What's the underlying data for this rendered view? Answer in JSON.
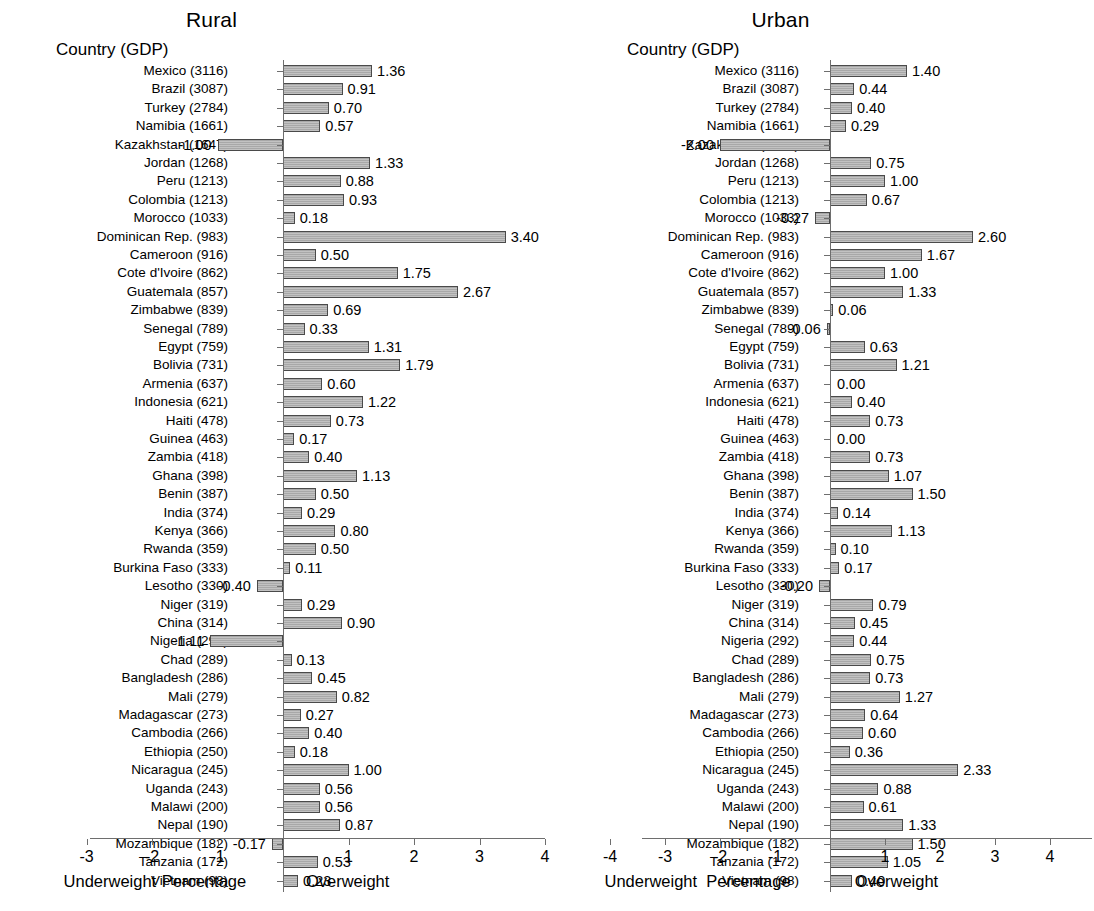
{
  "figure": {
    "bar_fill": "#a8a8a8",
    "bar_stroke": "#4a4a4a",
    "axis_color": "#6e6e6e"
  },
  "panels": [
    {
      "id": "rural",
      "title": "Rural",
      "column_header": "Country (GDP)",
      "axis": {
        "caption_left": "Underweight",
        "caption_center": "Percentage",
        "caption_right": "Overweight",
        "ticks": [
          -3,
          -2,
          -1,
          1,
          2,
          3,
          4
        ],
        "tick_labels": [
          "-3",
          "-2",
          "-1",
          "1",
          "2",
          "3",
          "4"
        ],
        "xlim": [
          -3.6,
          4.4
        ]
      }
    },
    {
      "id": "urban",
      "title": "Urban",
      "column_header": "Country (GDP)",
      "axis": {
        "caption_left": "Underweight",
        "caption_center": "Percentage",
        "caption_right": "Overweight",
        "ticks": [
          -4,
          -3,
          -2,
          -1,
          1,
          2,
          3,
          4
        ],
        "tick_labels": [
          "-4",
          "-3",
          "-2",
          "-1",
          "1",
          "2",
          "3",
          "4"
        ],
        "xlim": [
          -4.4,
          4.4
        ]
      }
    }
  ],
  "chart_data": [
    {
      "type": "bar",
      "orientation": "horizontal",
      "title": "Rural",
      "xlabel": "Percentage",
      "ylabel": "Country (GDP)",
      "xlim": [
        -3.6,
        4.4
      ],
      "grid": false,
      "legend": "none",
      "annotations": [
        "Underweight",
        "Percentage",
        "Overweight"
      ],
      "categories": [
        "Mexico (3116)",
        "Brazil (3087)",
        "Turkey (2784)",
        "Namibia (1661)",
        "Kazakhstan (1647)",
        "Jordan (1268)",
        "Peru (1213)",
        "Colombia (1213)",
        "Morocco (1033)",
        "Dominican Rep. (983)",
        "Cameroon (916)",
        "Cote d'Ivoire (862)",
        "Guatemala (857)",
        "Zimbabwe (839)",
        "Senegal (789)",
        "Egypt (759)",
        "Bolivia (731)",
        "Armenia (637)",
        "Indonesia (621)",
        "Haiti (478)",
        "Guinea (463)",
        "Zambia (418)",
        "Ghana (398)",
        "Benin (387)",
        "India (374)",
        "Kenya (366)",
        "Rwanda (359)",
        "Burkina Faso (333)",
        "Lesotho (330)",
        "Niger (319)",
        "China (314)",
        "Nigeria (292)",
        "Chad (289)",
        "Bangladesh (286)",
        "Mali (279)",
        "Madagascar (273)",
        "Cambodia (266)",
        "Ethiopia (250)",
        "Nicaragua (245)",
        "Uganda (243)",
        "Malawi (200)",
        "Nepal (190)",
        "Mozambique (182)",
        "Tanzania (172)",
        "Vietnam (98)"
      ],
      "values": [
        1.36,
        0.91,
        0.7,
        0.57,
        -1.0,
        1.33,
        0.88,
        0.93,
        0.18,
        3.4,
        0.5,
        1.75,
        2.67,
        0.69,
        0.33,
        1.31,
        1.79,
        0.6,
        1.22,
        0.73,
        0.17,
        0.4,
        1.13,
        0.5,
        0.29,
        0.8,
        0.5,
        0.11,
        -0.4,
        0.29,
        0.9,
        -1.11,
        0.13,
        0.45,
        0.82,
        0.27,
        0.4,
        0.18,
        1.0,
        0.56,
        0.56,
        0.87,
        -0.17,
        0.53,
        0.23
      ],
      "value_labels": [
        "1.36",
        "0.91",
        "0.70",
        "0.57",
        "-1.00",
        "1.33",
        "0.88",
        "0.93",
        "0.18",
        "3.40",
        "0.50",
        "1.75",
        "2.67",
        "0.69",
        "0.33",
        "1.31",
        "1.79",
        "0.60",
        "1.22",
        "0.73",
        "0.17",
        "0.40",
        "1.13",
        "0.50",
        "0.29",
        "0.80",
        "0.50",
        "0.11",
        "-0.40",
        "0.29",
        "0.90",
        "-1.11",
        "0.13",
        "0.45",
        "0.82",
        "0.27",
        "0.40",
        "0.18",
        "1.00",
        "0.56",
        "0.56",
        "0.87",
        "-0.17",
        "0.53",
        "0.23"
      ]
    },
    {
      "type": "bar",
      "orientation": "horizontal",
      "title": "Urban",
      "xlabel": "Percentage",
      "ylabel": "Country (GDP)",
      "xlim": [
        -4.4,
        4.4
      ],
      "grid": false,
      "legend": "none",
      "annotations": [
        "Underweight",
        "Percentage",
        "Overweight"
      ],
      "categories": [
        "Mexico (3116)",
        "Brazil (3087)",
        "Turkey (2784)",
        "Namibia (1661)",
        "Kazakhstan (1647)",
        "Jordan (1268)",
        "Peru (1213)",
        "Colombia (1213)",
        "Morocco (1033)",
        "Dominican Rep. (983)",
        "Cameroon (916)",
        "Cote d'Ivoire (862)",
        "Guatemala (857)",
        "Zimbabwe (839)",
        "Senegal (789)",
        "Egypt (759)",
        "Bolivia (731)",
        "Armenia (637)",
        "Indonesia (621)",
        "Haiti (478)",
        "Guinea (463)",
        "Zambia (418)",
        "Ghana (398)",
        "Benin (387)",
        "India (374)",
        "Kenya (366)",
        "Rwanda (359)",
        "Burkina Faso (333)",
        "Lesotho (330)",
        "Niger (319)",
        "China (314)",
        "Nigeria (292)",
        "Chad (289)",
        "Bangladesh (286)",
        "Mali (279)",
        "Madagascar (273)",
        "Cambodia (266)",
        "Ethiopia (250)",
        "Nicaragua (245)",
        "Uganda (243)",
        "Malawi (200)",
        "Nepal (190)",
        "Mozambique (182)",
        "Tanzania (172)",
        "Vietnam (98)"
      ],
      "values": [
        1.4,
        0.44,
        0.4,
        0.29,
        -2.0,
        0.75,
        1.0,
        0.67,
        -0.27,
        2.6,
        1.67,
        1.0,
        1.33,
        0.06,
        -0.06,
        0.63,
        1.21,
        0.0,
        0.4,
        0.73,
        0.0,
        0.73,
        1.07,
        1.5,
        0.14,
        1.13,
        0.1,
        0.17,
        -0.2,
        0.79,
        0.45,
        0.44,
        0.75,
        0.73,
        1.27,
        0.64,
        0.6,
        0.36,
        2.33,
        0.88,
        0.61,
        1.33,
        1.5,
        1.05,
        0.4
      ],
      "value_labels": [
        "1.40",
        "0.44",
        "0.40",
        "0.29",
        "-2.00",
        "0.75",
        "1.00",
        "0.67",
        "-0.27",
        "2.60",
        "1.67",
        "1.00",
        "1.33",
        "0.06",
        "-0.06",
        "0.63",
        "1.21",
        "0.00",
        "0.40",
        "0.73",
        "0.00",
        "0.73",
        "1.07",
        "1.50",
        "0.14",
        "1.13",
        "0.10",
        "0.17",
        "-0.20",
        "0.79",
        "0.45",
        "0.44",
        "0.75",
        "0.73",
        "1.27",
        "0.64",
        "0.60",
        "0.36",
        "2.33",
        "0.88",
        "0.61",
        "1.33",
        "1.50",
        "1.05",
        "0.40"
      ]
    }
  ]
}
